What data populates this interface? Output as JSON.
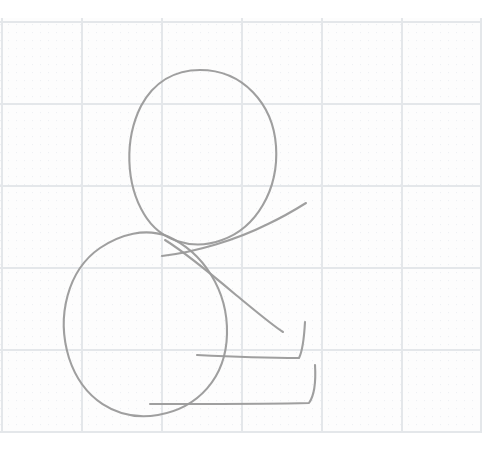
{
  "canvas": {
    "width": 502,
    "height": 456,
    "background_color": "#ffffff",
    "title": "hand-drawn seated figure sketch on graph paper"
  },
  "paper": {
    "name": "graph-paper",
    "sheet_left": 0,
    "sheet_top": 18,
    "sheet_right": 481,
    "sheet_bottom": 433,
    "minor_grid": {
      "visible": true,
      "spacing": 8,
      "color": "#eceef0",
      "style": "dotted"
    },
    "major_grid": {
      "visible": true,
      "spacing_x": 80,
      "spacing_y": 82,
      "color": "#e4e7ea",
      "style": "solid",
      "vertical_lines_x": [
        2,
        82,
        162,
        242,
        322,
        402,
        481
      ],
      "horizontal_lines_y": [
        22,
        104,
        186,
        268,
        350,
        432
      ]
    }
  },
  "sketch": {
    "stroke_color": "#9a9a9a",
    "stroke_width": 2.1,
    "stroke_opacity": 0.95,
    "strokes": [
      {
        "name": "head-oval",
        "type": "closed-curve",
        "label": "head",
        "center": [
          200,
          157
        ],
        "radius_x": 72,
        "radius_y": 88,
        "rotation_deg": -8,
        "path": "M 200,70 C 243,70 273,104 276,146 C 279,190 256,228 222,240 C 192,251 160,241 144,214 C 126,184 124,140 141,106 C 154,82 175,70 200,70 Z"
      },
      {
        "name": "body-oval",
        "type": "closed-curve",
        "label": "body",
        "center": [
          145,
          322
        ],
        "radius_x": 82,
        "radius_y": 90,
        "rotation_deg": 14,
        "path": "M 167,236 C 203,252 228,290 227,334 C 226,378 198,408 158,415 C 116,422 82,398 69,358 C 56,316 68,270 100,248 C 121,234 145,228 167,236 Z"
      },
      {
        "name": "upper-arm-stroke",
        "type": "open-curve",
        "label": "upper arm going up-right",
        "start": [
          162,
          256
        ],
        "end": [
          306,
          203
        ],
        "path": "M 162,256 C 196,252 236,240 268,224 C 285,216 298,208 306,203"
      },
      {
        "name": "lower-arm-stroke",
        "type": "open-curve",
        "label": "forearm going down-right",
        "start": [
          165,
          240
        ],
        "end": [
          283,
          332
        ],
        "path": "M 165,240 C 186,253 210,273 236,295 C 258,313 272,325 283,332"
      },
      {
        "name": "upper-leg-foot",
        "type": "open-polyline",
        "label": "upper leg and foot, L-shape",
        "path": "M 197,355 C 236,357 274,358 299,358 C 302,352 304,340 305,322"
      },
      {
        "name": "lower-leg-foot",
        "type": "open-polyline",
        "label": "lower leg and foot, L-shape",
        "path": "M 150,404 C 214,404 278,404 309,403 C 314,396 316,382 315,365"
      }
    ]
  }
}
